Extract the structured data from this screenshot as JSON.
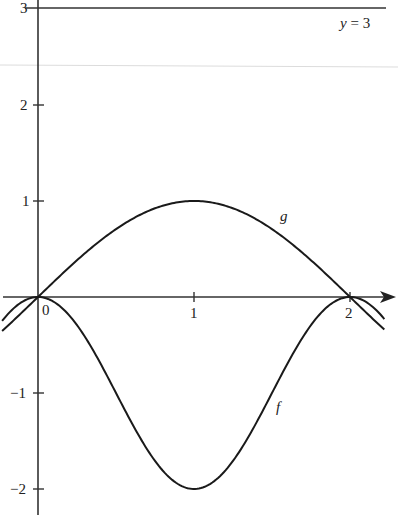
{
  "chart_data": {
    "type": "line",
    "title": "",
    "xlabel": "",
    "ylabel": "",
    "xlim": [
      -0.24,
      2.27
    ],
    "ylim": [
      -2.2,
      3.08
    ],
    "grid": false,
    "x_ticks": [
      {
        "value": 0,
        "label": "0"
      },
      {
        "value": 1,
        "label": "1"
      },
      {
        "value": 2,
        "label": "2"
      }
    ],
    "y_ticks": [
      {
        "value": 3,
        "label": "3"
      },
      {
        "value": 2,
        "label": "2"
      },
      {
        "value": 1,
        "label": "1"
      },
      {
        "value": -1,
        "label": "−1"
      },
      {
        "value": -2,
        "label": "−2"
      }
    ],
    "series": [
      {
        "name": "g",
        "description": "g(x) = sin(πx/2)",
        "x": [
          -0.23,
          0,
          0.25,
          0.5,
          0.75,
          1,
          1.25,
          1.5,
          1.75,
          2,
          2.22
        ],
        "values": [
          -0.35,
          0,
          0.38,
          0.71,
          0.92,
          1,
          0.92,
          0.71,
          0.38,
          0,
          -0.34
        ],
        "label_position": {
          "x": 1.6,
          "y": 0.82
        }
      },
      {
        "name": "f",
        "description": "f(x) = cos(πx) − 1",
        "x": [
          -0.23,
          0,
          0.25,
          0.5,
          0.75,
          1,
          1.25,
          1.5,
          1.75,
          2,
          2.22
        ],
        "values": [
          -0.25,
          0,
          -0.29,
          -1,
          -1.71,
          -2,
          -1.71,
          -1,
          -0.29,
          0,
          -0.23
        ],
        "label_position": {
          "x": 1.57,
          "y": -1.15
        }
      },
      {
        "name": "y = 3",
        "description": "horizontal line y = 3",
        "x": [
          -0.24,
          2.27
        ],
        "values": [
          3,
          3
        ],
        "label_position": {
          "x": 2.1,
          "y": 2.8
        }
      }
    ],
    "annotations": [
      {
        "text": "g",
        "near": "upper curve at x≈1.6"
      },
      {
        "text": "f",
        "near": "lower curve at x≈1.55"
      },
      {
        "text": "y = 3",
        "near": "top-right, below horizontal line"
      },
      {
        "text": "0",
        "near": "origin"
      }
    ],
    "legend": null
  },
  "labels": {
    "g": "g",
    "f": "f",
    "line": "y = 3",
    "origin": "0",
    "x1": "1",
    "x2": "2",
    "y3": "3",
    "y2": "2",
    "y1": "1",
    "ym1": "−1",
    "ym2": "−2"
  }
}
